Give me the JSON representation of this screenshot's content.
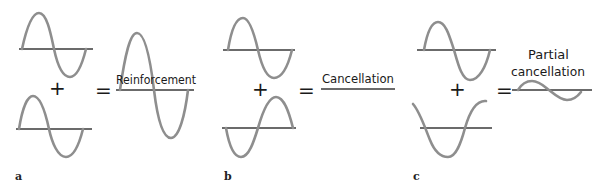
{
  "figure": {
    "colors": {
      "wave": "#8e8e8e",
      "axis": "#3a3a3a",
      "text": "#1a1a1a",
      "background": "#ffffff"
    },
    "operators": {
      "plus": "+",
      "equals": "="
    },
    "panels": [
      {
        "id": "a",
        "label": "a",
        "result_label": "Reinforcement",
        "wave1": "in phase, full amplitude",
        "wave2": "in phase, full amplitude",
        "result": "double amplitude wave"
      },
      {
        "id": "b",
        "label": "b",
        "result_label": "Cancellation",
        "wave1": "full amplitude",
        "wave2": "180 degrees out of phase, full amplitude",
        "result": "flat line (no wave)"
      },
      {
        "id": "c",
        "label": "c",
        "result_label_line1": "Partial",
        "result_label_line2": "cancellation",
        "wave1": "full amplitude",
        "wave2": "partially out of phase",
        "result": "reduced amplitude wave"
      }
    ]
  }
}
